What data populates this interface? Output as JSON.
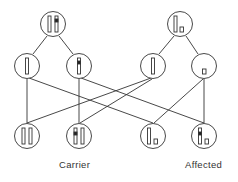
{
  "diagram": {
    "type": "genetic-inheritance-cross",
    "colors": {
      "stroke": "#333333",
      "fill": "#ffffff",
      "allele_mark": "#222222"
    },
    "parents": [
      {
        "id": "parent-carrier",
        "chromosomes": [
          "long-normal",
          "long-marked"
        ]
      },
      {
        "id": "parent-affected-male",
        "chromosomes": [
          "long-normal",
          "short"
        ]
      }
    ],
    "gametes": [
      {
        "id": "gamete-1",
        "from": "parent-carrier",
        "chromosome": "long-normal"
      },
      {
        "id": "gamete-2",
        "from": "parent-carrier",
        "chromosome": "long-marked"
      },
      {
        "id": "gamete-3",
        "from": "parent-affected-male",
        "chromosome": "long-normal"
      },
      {
        "id": "gamete-4",
        "from": "parent-affected-male",
        "chromosome": "short"
      }
    ],
    "offspring": [
      {
        "id": "offspring-1",
        "chromosomes": [
          "long-normal",
          "long-normal"
        ],
        "label": ""
      },
      {
        "id": "offspring-2",
        "chromosomes": [
          "long-marked",
          "long-normal"
        ],
        "label": "Carrier"
      },
      {
        "id": "offspring-3",
        "chromosomes": [
          "long-normal",
          "short"
        ],
        "label": ""
      },
      {
        "id": "offspring-4",
        "chromosomes": [
          "long-marked",
          "short"
        ],
        "label": "Affected"
      }
    ],
    "labels": {
      "carrier": "Carrier",
      "affected": "Affected"
    }
  }
}
